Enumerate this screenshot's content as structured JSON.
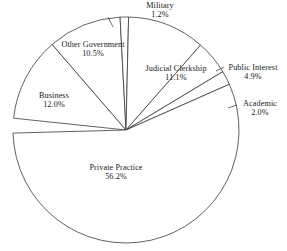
{
  "chart_data": {
    "type": "pie",
    "title": "",
    "subtitle": "",
    "xlabel": "",
    "ylabel": "",
    "legend_position": "none",
    "grid": false,
    "units": "percent",
    "labels_inline": true,
    "categories": [
      "Business",
      "Other Government",
      "Military",
      "Judicial Clerkship",
      "Public Interest",
      "Academic",
      "Private Practice"
    ],
    "values": [
      12.0,
      10.5,
      1.2,
      11.1,
      4.9,
      2.0,
      56.2
    ],
    "slices": [
      {
        "name": "Business",
        "value": 12.0,
        "value_text": "12.0%",
        "label_text": "Business",
        "has_leader": false
      },
      {
        "name": "Other Government",
        "value": 10.5,
        "value_text": "10.5%",
        "label_text": "Other Government",
        "has_leader": false
      },
      {
        "name": "Military",
        "value": 1.2,
        "value_text": "1.2%",
        "label_text": "Military",
        "has_leader": true
      },
      {
        "name": "Judicial Clerkship",
        "value": 11.1,
        "value_text": "11.1%",
        "label_text": "Judicial Clerkship",
        "has_leader": false
      },
      {
        "name": "Public Interest",
        "value": 4.9,
        "value_text": "4.9%",
        "label_text": "Public Interest",
        "has_leader": true
      },
      {
        "name": "Academic",
        "value": 2.0,
        "value_text": "2.0%",
        "label_text": "Academic",
        "has_leader": true
      },
      {
        "name": "Private Practice",
        "value": 56.2,
        "value_text": "56.2%",
        "label_text": "Private Practice",
        "has_leader": false
      }
    ],
    "colors": {
      "slice_fill": "#ffffff",
      "slice_stroke": "#3a3a3a",
      "text": "#1a1a1a",
      "background": "#ffffff"
    }
  }
}
